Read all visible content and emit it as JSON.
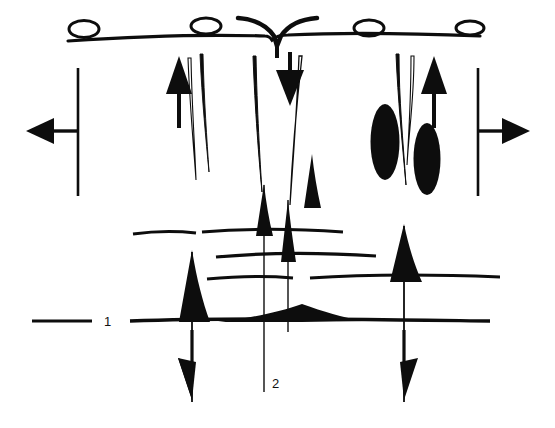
{
  "figure": {
    "title": "",
    "kind": "geological-cross-section-diagram",
    "background_color": "#ffffff",
    "ink_color": "#0d0d0d",
    "width": 555,
    "height": 428
  },
  "labels": [
    {
      "name": "horizon-label-1",
      "text": "1",
      "x": 105,
      "y": 325
    },
    {
      "name": "horizon-label-2",
      "text": "2",
      "x": 274,
      "y": 384
    }
  ],
  "annotations": {
    "label_1_tick": {
      "name": "horizon-1-leader-line",
      "x1": 30,
      "y1": 320,
      "x2": 92,
      "y2": 320
    },
    "label_2_leader": {
      "name": "horizon-2-leader-line",
      "x1": 264,
      "y1": 330,
      "x2": 264,
      "y2": 392
    }
  },
  "surface": {
    "name": "ground-surface-line",
    "y": 38,
    "x_start": 68,
    "x_end": 480
  },
  "surface_circles": [
    {
      "name": "surface-ellipse-1",
      "cx": 84,
      "cy": 29,
      "rx": 15,
      "ry": 8
    },
    {
      "name": "surface-ellipse-2",
      "cx": 206,
      "cy": 26,
      "rx": 15,
      "ry": 8
    },
    {
      "name": "surface-ellipse-3",
      "cx": 369,
      "cy": 28,
      "rx": 15,
      "ry": 8
    },
    {
      "name": "surface-ellipse-4",
      "cx": 470,
      "cy": 28,
      "rx": 14,
      "ry": 7
    }
  ],
  "filled_ellipses": [
    {
      "name": "solid-ellipse-left",
      "cx": 385,
      "cy": 142,
      "rx": 14,
      "ry": 38,
      "rotation": 0
    },
    {
      "name": "solid-ellipse-right",
      "cx": 427,
      "cy": 158,
      "rx": 13,
      "ry": 36,
      "rotation": 0
    }
  ],
  "horizons": [
    {
      "name": "reflector-upper-left",
      "y": 233,
      "x_start": 133,
      "x_end": 196
    },
    {
      "name": "reflector-upper-mid",
      "y": 231,
      "x_start": 202,
      "x_end": 343
    },
    {
      "name": "reflector-middle",
      "y": 256,
      "x_start": 216,
      "x_end": 376
    },
    {
      "name": "reflector-lower-left",
      "y": 278,
      "x_start": 207,
      "x_end": 293
    },
    {
      "name": "reflector-lower-right",
      "y": 277,
      "x_start": 310,
      "x_end": 500
    },
    {
      "name": "horizon-1-main",
      "y": 320,
      "x_start": 130,
      "x_end": 490
    }
  ],
  "vertical_faults": [
    {
      "name": "fault-line-center-left",
      "x": 264,
      "y_top": 56,
      "y_bottom": 392
    },
    {
      "name": "fault-line-center-right",
      "x": 287,
      "y_top": 56,
      "y_bottom": 330
    },
    {
      "name": "fault-line-left",
      "x": 192,
      "y_top": 60,
      "y_bottom": 400
    },
    {
      "name": "fault-line-right",
      "x": 404,
      "y_top": 60,
      "y_bottom": 400
    }
  ],
  "arrows": [
    {
      "name": "arrow-left-extension",
      "direction": "left",
      "tip_x": 28,
      "tip_y": 131,
      "tail_x": 80,
      "tail_y": 131
    },
    {
      "name": "arrow-right-extension",
      "direction": "right",
      "tip_x": 528,
      "tip_y": 131,
      "tail_x": 476,
      "tail_y": 131
    },
    {
      "name": "arrow-up-left",
      "direction": "up",
      "x": 178,
      "tip_y": 58,
      "tail_y": 120
    },
    {
      "name": "arrow-up-right",
      "direction": "up",
      "x": 434,
      "tip_y": 58,
      "tail_y": 120
    },
    {
      "name": "arrow-down-center",
      "direction": "down",
      "x": 290,
      "tip_y": 103,
      "tail_y": 50
    },
    {
      "name": "arrow-down-left-lower",
      "direction": "down",
      "x": 192,
      "tip_y": 398,
      "tail_y": 330
    },
    {
      "name": "arrow-down-right-lower",
      "direction": "down",
      "x": 404,
      "tip_y": 398,
      "tail_y": 330
    }
  ],
  "reference_bars": [
    {
      "name": "datum-bar-left",
      "x": 78,
      "y_top": 68,
      "y_bottom": 196
    },
    {
      "name": "datum-bar-right",
      "x": 478,
      "y_top": 68,
      "y_bottom": 196
    }
  ],
  "spikes": [
    {
      "name": "diapir-spike-left",
      "apex_x": 192,
      "apex_y": 252,
      "base_y": 322,
      "half_width": 15
    },
    {
      "name": "diapir-spike-right",
      "apex_x": 404,
      "apex_y": 225,
      "base_y": 282,
      "half_width": 16
    },
    {
      "name": "diapir-spike-center-left",
      "apex_x": 264,
      "apex_y": 185,
      "base_y": 236,
      "half_width": 9
    },
    {
      "name": "diapir-spike-center-right",
      "apex_x": 288,
      "apex_y": 200,
      "base_y": 261,
      "half_width": 9
    },
    {
      "name": "diapir-spike-inner-right",
      "apex_x": 312,
      "apex_y": 155,
      "base_y": 207,
      "half_width": 9
    }
  ],
  "wedges": [
    {
      "name": "wedge-left-of-center",
      "x_tip": 300,
      "x_base": 215,
      "y": 320
    },
    {
      "name": "wedge-right-of-center",
      "x_tip": 300,
      "x_base": 360,
      "y": 320
    }
  ],
  "taper_lines": [
    {
      "name": "taper-left-inner",
      "x": 207,
      "y_top": 54,
      "y_bottom": 170
    },
    {
      "name": "taper-center-a",
      "x": 257,
      "y_top": 54,
      "y_bottom": 210
    },
    {
      "name": "taper-center-b",
      "x": 296,
      "y_top": 54,
      "y_bottom": 230
    },
    {
      "name": "taper-right-inner",
      "x": 392,
      "y_top": 52,
      "y_bottom": 180
    }
  ]
}
